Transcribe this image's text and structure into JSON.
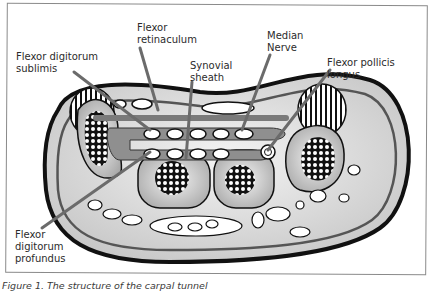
{
  "figure": {
    "caption": "Figure 1.  The structure of the carpal tunnel",
    "colors": {
      "outline": "#111111",
      "leader_line": "#6b6b6b",
      "tissue_fill": "#d9d9d9",
      "sheath_fill": "#8c8c8c",
      "background": "#ffffff"
    }
  },
  "labels": [
    {
      "id": "flexor-retinaculum",
      "text": "Flexor\nretinaculum"
    },
    {
      "id": "median-nerve",
      "text": "Median\nNerve"
    },
    {
      "id": "flexor-digitorum-sublimis",
      "text": "Flexor digitorum\nsublimis"
    },
    {
      "id": "synovial-sheath",
      "text": "Synovial\nsheath"
    },
    {
      "id": "flexor-pollicis-longus",
      "text": "Flexor pollicis longus"
    },
    {
      "id": "flexor-digitorum-profundus",
      "text": "Flexor\ndigitorum\nprofundus"
    }
  ]
}
